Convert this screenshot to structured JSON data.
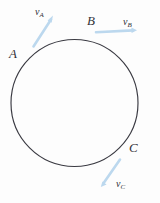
{
  "figure": {
    "type": "physics-diagram",
    "background_color": "#fdfdfd",
    "circle": {
      "stroke_color": "#3a3a42",
      "stroke_width": 1.1,
      "center_x": 74.5,
      "center_y": 103,
      "radius": 63.5
    },
    "points": [
      {
        "id": "A",
        "label": "A",
        "x": 29.5,
        "y": 58,
        "angle_deg": 135
      },
      {
        "id": "B",
        "label": "B",
        "x": 90,
        "y": 31.5,
        "angle_deg": 75
      },
      {
        "id": "C",
        "label": "C",
        "x": 126,
        "y": 148,
        "angle_deg": -45
      }
    ],
    "vectors": [
      {
        "id": "vA",
        "label": "v",
        "subscript": "A",
        "color": "#bcd8ee",
        "tail_x": 33,
        "tail_y": 46,
        "tip_x": 53,
        "tip_y": 16,
        "direction": "up-right"
      },
      {
        "id": "vB",
        "label": "v",
        "subscript": "B",
        "color": "#bcd8ee",
        "tail_x": 96,
        "tail_y": 32,
        "tip_x": 136,
        "tip_y": 30,
        "direction": "right"
      },
      {
        "id": "vC",
        "label": "v",
        "subscript": "C",
        "color": "#bcd8ee",
        "tail_x": 120,
        "tail_y": 160,
        "tip_x": 101,
        "tip_y": 186,
        "direction": "down-left"
      }
    ]
  }
}
